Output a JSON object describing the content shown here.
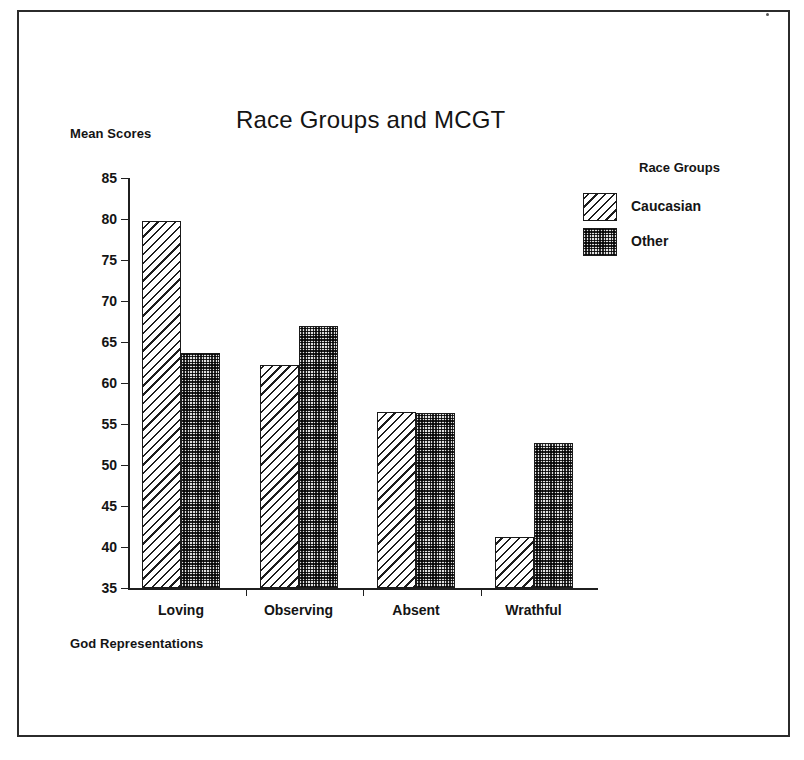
{
  "figure": {
    "title": "Race Groups and MCGT",
    "y_axis_label": "Mean Scores",
    "x_axis_label": "God Representations",
    "legend_title": "Race Groups",
    "frame_color": "#2b2b2b",
    "ink_color": "#141414"
  },
  "legend": {
    "title": "Race Groups",
    "entries": [
      {
        "label": "Caucasian",
        "pattern": "diagonal-hatch",
        "color": "#ffffff"
      },
      {
        "label": "Other",
        "pattern": "dark-checker",
        "color": "#2a2a2a"
      }
    ]
  },
  "chart_data": {
    "type": "bar",
    "title": "Race Groups and MCGT",
    "xlabel": "God Representations",
    "ylabel": "Mean Scores",
    "categories": [
      "Loving",
      "Observing",
      "Absent",
      "Wrathful"
    ],
    "series": [
      {
        "name": "Caucasian",
        "values": [
          79.7,
          62.2,
          56.5,
          41.2
        ]
      },
      {
        "name": "Other",
        "values": [
          63.6,
          66.9,
          56.3,
          52.7
        ]
      }
    ],
    "ylim": [
      35,
      85
    ],
    "yticks": [
      35,
      40,
      45,
      50,
      55,
      60,
      65,
      70,
      75,
      80,
      85
    ],
    "ytick_labels": [
      "35",
      "40",
      "45",
      "50",
      "55",
      "60",
      "65",
      "70",
      "75",
      "80",
      "85"
    ],
    "grid": false,
    "legend_position": "top-right-outside"
  }
}
